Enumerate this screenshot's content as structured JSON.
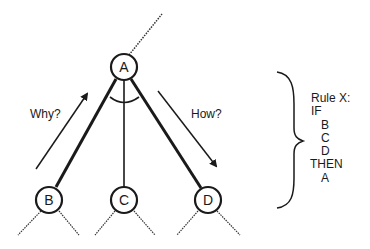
{
  "diagram": {
    "nodes": [
      {
        "id": "A",
        "label": "A"
      },
      {
        "id": "B",
        "label": "B"
      },
      {
        "id": "C",
        "label": "C"
      },
      {
        "id": "D",
        "label": "D"
      }
    ],
    "edges": [
      {
        "from": "A",
        "to": "B",
        "style": "thick"
      },
      {
        "from": "A",
        "to": "C",
        "style": "normal"
      },
      {
        "from": "A",
        "to": "D",
        "style": "thick"
      }
    ],
    "arrows": {
      "why": {
        "label": "Why?",
        "direction": "up"
      },
      "how": {
        "label": "How?",
        "direction": "down"
      }
    },
    "rule": {
      "title": "Rule X:",
      "if_label": "IF",
      "conditions": [
        "B",
        "C",
        "D"
      ],
      "then_label": "THEN",
      "conclusion": "A"
    }
  }
}
